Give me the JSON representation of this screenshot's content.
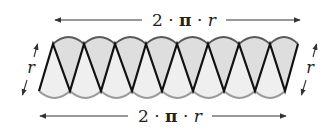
{
  "diagram": {
    "top_label": "2 · π · r",
    "bottom_label": "2 · π · r",
    "left_label": "r",
    "right_label": "r",
    "sector_count": 16,
    "colors": {
      "top_sector_fill": "#dedede",
      "bottom_sector_fill": "#efefef",
      "top_arc_stroke": "#5a5a5a",
      "bottom_arc_stroke": "#9a9a9a",
      "radius_stroke": "#111111",
      "arrow_stroke": "#333333",
      "background": "#ffffff"
    },
    "geometry": {
      "top_vertices_x": [
        53,
        84,
        115,
        146,
        177,
        208,
        239,
        270,
        298
      ],
      "bottom_vertices_x": [
        39,
        70,
        101,
        132,
        162,
        193,
        224,
        255,
        285
      ],
      "top_y": 44,
      "bottom_y": 91
    }
  }
}
